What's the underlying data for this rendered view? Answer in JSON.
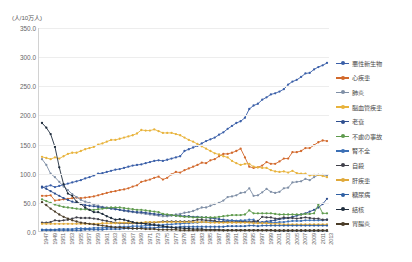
{
  "chart_data": {
    "type": "line",
    "title": "",
    "subtitle": "",
    "unit_label": "(人/10万人)",
    "xlabel": "",
    "ylabel": "",
    "ylim": [
      0,
      350
    ],
    "ytick_labels": [
      "350.0",
      "300.0",
      "250.0",
      "200.0",
      "150.0",
      "100.0",
      "50.0",
      "0.0"
    ],
    "ytick_values": [
      350,
      300,
      250,
      200,
      150,
      100,
      50,
      0
    ],
    "grid": true,
    "legend_position": "right",
    "x": [
      1947,
      1948,
      1949,
      1950,
      1951,
      1952,
      1953,
      1954,
      1955,
      1956,
      1957,
      1958,
      1959,
      1960,
      1961,
      1962,
      1963,
      1964,
      1965,
      1966,
      1967,
      1968,
      1969,
      1970,
      1971,
      1972,
      1973,
      1974,
      1975,
      1976,
      1977,
      1978,
      1979,
      1980,
      1981,
      1982,
      1983,
      1984,
      1985,
      1986,
      1987,
      1988,
      1989,
      1990,
      1991,
      1992,
      1993,
      1994,
      1995,
      1996,
      1997,
      1998,
      1999,
      2000,
      2001,
      2002,
      2003,
      2004,
      2005,
      2006,
      2007,
      2008,
      2009,
      2010,
      2011,
      2012,
      2013
    ],
    "xtick_labels": [
      "1947",
      "1949",
      "1951",
      "1953",
      "1955",
      "1957",
      "1959",
      "1961",
      "1963",
      "1965",
      "1967",
      "1969",
      "1971",
      "1973",
      "1975",
      "1977",
      "1979",
      "1981",
      "1983",
      "1985",
      "1987",
      "1989",
      "1991",
      "1993",
      "1995",
      "1997",
      "1999",
      "2001",
      "2003",
      "2005",
      "2007",
      "2009",
      "2011",
      "2013"
    ],
    "series": [
      {
        "name": "悪性新生物",
        "color": "#3a5fa8",
        "values": [
          76,
          78,
          80,
          77,
          79,
          81,
          83,
          85,
          87,
          89,
          92,
          94,
          97,
          100,
          101,
          103,
          105,
          107,
          108,
          110,
          112,
          114,
          115,
          116,
          118,
          120,
          122,
          123,
          122,
          124,
          126,
          128,
          130,
          139,
          142,
          145,
          148,
          152,
          156,
          159,
          162,
          167,
          171,
          177,
          182,
          187,
          190,
          196,
          211,
          217,
          220,
          227,
          231,
          236,
          238,
          241,
          245,
          253,
          258,
          261,
          266,
          272,
          273,
          279,
          283,
          286,
          290
        ]
      },
      {
        "name": "心疾患",
        "color": "#d2692c",
        "values": [
          62,
          62,
          63,
          54,
          55,
          56,
          57,
          58,
          59,
          58,
          59,
          60,
          61,
          63,
          65,
          67,
          69,
          70,
          72,
          73,
          75,
          78,
          80,
          86,
          88,
          90,
          93,
          95,
          90,
          93,
          99,
          103,
          102,
          106,
          109,
          112,
          115,
          119,
          118,
          123,
          125,
          130,
          134,
          134,
          136,
          139,
          143,
          128,
          112,
          110,
          111,
          114,
          120,
          117,
          117,
          121,
          126,
          126,
          137,
          137,
          139,
          144,
          144,
          149,
          154,
          157,
          156
        ]
      },
      {
        "name": "肺炎",
        "color": "#7f8fa6",
        "values": [
          125,
          115,
          100,
          94,
          86,
          78,
          72,
          65,
          60,
          55,
          52,
          50,
          47,
          45,
          43,
          42,
          41,
          40,
          38,
          36,
          35,
          34,
          33,
          32,
          31,
          30,
          29,
          28,
          27,
          27,
          28,
          30,
          31,
          33,
          34,
          36,
          39,
          42,
          42,
          45,
          48,
          50,
          54,
          60,
          61,
          63,
          67,
          68,
          75,
          62,
          63,
          68,
          74,
          69,
          67,
          69,
          75,
          76,
          85,
          86,
          87,
          91,
          89,
          94,
          98,
          98,
          97
        ]
      },
      {
        "name": "脳血管疾患",
        "color": "#e8b33c",
        "values": [
          129,
          127,
          125,
          128,
          126,
          130,
          134,
          136,
          136,
          139,
          142,
          144,
          146,
          150,
          152,
          155,
          158,
          158,
          160,
          162,
          164,
          166,
          169,
          175,
          174,
          174,
          176,
          173,
          170,
          170,
          170,
          168,
          166,
          162,
          158,
          155,
          151,
          147,
          143,
          139,
          135,
          133,
          130,
          128,
          122,
          118,
          115,
          117,
          117,
          112,
          111,
          110,
          110,
          106,
          104,
          103,
          104,
          102,
          105,
          101,
          100,
          100,
          97,
          98,
          98,
          96,
          94
        ]
      },
      {
        "name": "老衰",
        "color": "#2f4f8f",
        "values": [
          78,
          74,
          70,
          66,
          62,
          58,
          55,
          52,
          50,
          48,
          46,
          45,
          44,
          43,
          42,
          41,
          40,
          39,
          38,
          37,
          36,
          35,
          34,
          34,
          33,
          32,
          31,
          30,
          30,
          29,
          29,
          28,
          28,
          27,
          27,
          26,
          26,
          25,
          25,
          24,
          23,
          22,
          21,
          20,
          20,
          19,
          18,
          18,
          17,
          17,
          17,
          17,
          18,
          19,
          20,
          22,
          23,
          24,
          26,
          28,
          30,
          32,
          35,
          38,
          42,
          48,
          57
        ]
      },
      {
        "name": "不慮の事故",
        "color": "#5e9a4c",
        "values": [
          56,
          53,
          50,
          47,
          45,
          43,
          42,
          41,
          40,
          39,
          39,
          38,
          38,
          39,
          40,
          41,
          42,
          42,
          42,
          41,
          40,
          39,
          38,
          38,
          37,
          36,
          35,
          34,
          31,
          30,
          29,
          28,
          27,
          26,
          26,
          25,
          25,
          25,
          25,
          25,
          25,
          26,
          27,
          28,
          29,
          29,
          29,
          30,
          37,
          32,
          32,
          32,
          32,
          32,
          31,
          30,
          30,
          30,
          30,
          30,
          30,
          31,
          31,
          32,
          47,
          32,
          32
        ]
      },
      {
        "name": "腎不全",
        "color": "#3b6fb5",
        "values": [
          4,
          4,
          4,
          4,
          5,
          5,
          5,
          5,
          6,
          6,
          6,
          6,
          7,
          7,
          7,
          8,
          8,
          8,
          9,
          9,
          9,
          10,
          10,
          10,
          11,
          11,
          12,
          12,
          12,
          13,
          13,
          14,
          14,
          15,
          15,
          16,
          16,
          17,
          17,
          17,
          18,
          18,
          18,
          19,
          19,
          19,
          20,
          20,
          21,
          21,
          16,
          16,
          16,
          16,
          16,
          17,
          17,
          18,
          19,
          19,
          19,
          20,
          20,
          20,
          20,
          20,
          21
        ]
      },
      {
        "name": "自殺",
        "color": "#40404a",
        "values": [
          16,
          16,
          17,
          20,
          19,
          20,
          21,
          23,
          25,
          24,
          24,
          24,
          23,
          22,
          20,
          19,
          17,
          16,
          15,
          15,
          15,
          15,
          15,
          15,
          15,
          16,
          16,
          17,
          18,
          18,
          18,
          18,
          18,
          18,
          18,
          19,
          21,
          21,
          20,
          20,
          19,
          17,
          17,
          17,
          17,
          17,
          17,
          17,
          17,
          18,
          19,
          26,
          25,
          25,
          23,
          23,
          25,
          24,
          24,
          23,
          24,
          25,
          24,
          23,
          23,
          21,
          21
        ]
      },
      {
        "name": "肝疾患",
        "color": "#e0a93a",
        "values": [
          14,
          14,
          14,
          14,
          14,
          14,
          14,
          14,
          14,
          14,
          14,
          14,
          14,
          14,
          15,
          15,
          15,
          15,
          16,
          16,
          16,
          16,
          16,
          16,
          17,
          17,
          17,
          17,
          17,
          17,
          17,
          17,
          17,
          17,
          17,
          17,
          17,
          17,
          17,
          16,
          16,
          16,
          16,
          16,
          16,
          16,
          16,
          16,
          16,
          15,
          15,
          15,
          15,
          14,
          14,
          14,
          13,
          13,
          13,
          13,
          13,
          13,
          13,
          13,
          13,
          13,
          13
        ]
      },
      {
        "name": "糖尿病",
        "color": "#2e5fa3",
        "values": [
          3,
          3,
          3,
          3,
          3,
          3,
          3,
          3,
          3,
          3,
          4,
          4,
          4,
          4,
          4,
          5,
          5,
          5,
          5,
          6,
          6,
          6,
          6,
          7,
          7,
          7,
          7,
          8,
          8,
          8,
          8,
          8,
          9,
          9,
          9,
          9,
          9,
          9,
          9,
          9,
          9,
          9,
          9,
          10,
          10,
          10,
          10,
          10,
          11,
          11,
          10,
          11,
          11,
          11,
          11,
          11,
          11,
          11,
          11,
          11,
          11,
          11,
          11,
          11,
          11,
          11,
          11
        ]
      },
      {
        "name": "結核",
        "color": "#1f2d3d",
        "values": [
          187,
          179,
          168,
          146,
          111,
          82,
          66,
          62,
          52,
          48,
          42,
          38,
          34,
          34,
          31,
          27,
          24,
          21,
          22,
          21,
          19,
          17,
          15,
          15,
          14,
          13,
          12,
          11,
          10,
          9,
          8,
          7,
          7,
          6,
          6,
          5,
          5,
          5,
          4,
          4,
          4,
          4,
          3,
          3,
          3,
          3,
          3,
          3,
          3,
          3,
          3,
          3,
          3,
          3,
          2,
          2,
          2,
          2,
          2,
          2,
          2,
          2,
          2,
          2,
          2,
          2,
          2
        ]
      },
      {
        "name": "胃腸炎",
        "color": "#4a3c28",
        "values": [
          51,
          46,
          40,
          35,
          30,
          26,
          23,
          20,
          18,
          16,
          15,
          14,
          13,
          12,
          11,
          10,
          9,
          8,
          8,
          7,
          7,
          6,
          6,
          6,
          5,
          5,
          5,
          4,
          4,
          4,
          4,
          4,
          3,
          3,
          3,
          3,
          3,
          3,
          3,
          3,
          3,
          3,
          3,
          3,
          3,
          3,
          3,
          3,
          3,
          3,
          3,
          3,
          3,
          3,
          3,
          3,
          3,
          3,
          3,
          3,
          3,
          3,
          3,
          3,
          3,
          3,
          3
        ]
      }
    ]
  }
}
